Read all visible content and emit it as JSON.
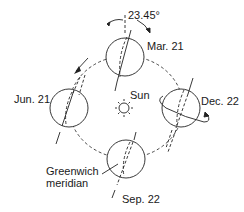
{
  "diagram": {
    "tilt_label": "23.45°",
    "sun_label": "Sun",
    "positions": [
      {
        "id": "mar",
        "label": "Mar. 21"
      },
      {
        "id": "jun",
        "label": "Jun. 21"
      },
      {
        "id": "sep",
        "label": "Sep. 22"
      },
      {
        "id": "dec",
        "label": "Dec. 22"
      }
    ],
    "meridian_label_line1": "Greenwich",
    "meridian_label_line2": "meridian",
    "colors": {
      "stroke": "#222222",
      "background": "#ffffff"
    }
  }
}
